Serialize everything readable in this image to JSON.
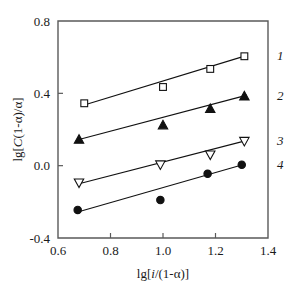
{
  "chart_data": {
    "type": "scatter",
    "title": "",
    "xlabel": "lg[i/(1-α)]",
    "ylabel": "lg[C(1-α)/α]",
    "xlim": [
      0.6,
      1.4
    ],
    "ylim": [
      -0.4,
      0.8
    ],
    "xticks": [
      "0.6",
      "0.8",
      "1.0",
      "1.2",
      "1.4"
    ],
    "yticks": [
      "0.8",
      "0.4",
      "0.0",
      "-0.4"
    ],
    "xtick_values": [
      0.6,
      0.8,
      1.0,
      1.2,
      1.4
    ],
    "ytick_values": [
      0.8,
      0.4,
      0.0,
      -0.4
    ],
    "grid": false,
    "legend_position": "right-inline",
    "series": [
      {
        "name": "1",
        "marker": "open-square",
        "points": [
          {
            "x": 0.7,
            "y": 0.345
          },
          {
            "x": 1.0,
            "y": 0.435
          },
          {
            "x": 1.18,
            "y": 0.535
          },
          {
            "x": 1.31,
            "y": 0.605
          }
        ],
        "fit_line": {
          "x1": 0.7,
          "y1": 0.335,
          "x2": 1.32,
          "y2": 0.61
        }
      },
      {
        "name": "2",
        "marker": "filled-triangle-up",
        "points": [
          {
            "x": 0.68,
            "y": 0.145
          },
          {
            "x": 1.0,
            "y": 0.225
          },
          {
            "x": 1.18,
            "y": 0.315
          },
          {
            "x": 1.31,
            "y": 0.385
          }
        ],
        "fit_line": {
          "x1": 0.68,
          "y1": 0.145,
          "x2": 1.32,
          "y2": 0.39
        }
      },
      {
        "name": "3",
        "marker": "open-triangle-down",
        "points": [
          {
            "x": 0.68,
            "y": -0.095
          },
          {
            "x": 0.99,
            "y": 0.005
          },
          {
            "x": 1.18,
            "y": 0.06
          },
          {
            "x": 1.31,
            "y": 0.135
          }
        ],
        "fit_line": {
          "x1": 0.68,
          "y1": -0.1,
          "x2": 1.32,
          "y2": 0.14
        }
      },
      {
        "name": "4",
        "marker": "filled-circle",
        "points": [
          {
            "x": 0.675,
            "y": -0.245
          },
          {
            "x": 0.99,
            "y": -0.19
          },
          {
            "x": 1.17,
            "y": -0.045
          },
          {
            "x": 1.3,
            "y": 0.005
          }
        ],
        "fit_line": {
          "x1": 0.672,
          "y1": -0.258,
          "x2": 1.31,
          "y2": 0.008
        }
      }
    ]
  },
  "axis_labels": {
    "x_title": "lg[i/(1-α)]",
    "y_title": "lg[C(1-α)/α]"
  },
  "colors": {
    "frame": "#5a5a5a",
    "data": "#111111",
    "background": "#ffffff"
  }
}
